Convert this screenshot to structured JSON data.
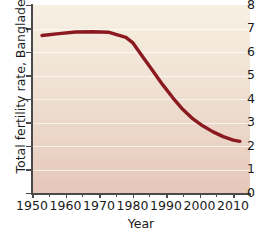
{
  "chart_data": {
    "type": "line",
    "title": "",
    "xlabel": "Year",
    "ylabel": "Total fertility rate, Bangladesh",
    "xlim": [
      1950,
      2015
    ],
    "ylim": [
      0,
      8
    ],
    "grid": true,
    "legend": "none",
    "line_color": "#8b1a20",
    "plot_bg_top": "#f7f1e3",
    "plot_bg_bottom": "#e6c7ba",
    "gridline_color": "#ffffff",
    "axis_color": "#4a4a4a",
    "yticks": [
      0,
      1,
      2,
      3,
      4,
      5,
      6,
      7,
      8
    ],
    "ytick_labels": [
      "0",
      "1",
      "2",
      "3",
      "4",
      "5",
      "6",
      "7",
      "8"
    ],
    "xticks_major": [
      1950,
      1960,
      1970,
      1980,
      1990,
      2000,
      2010
    ],
    "xtick_labels": [
      "1950",
      "1960",
      "1970",
      "1980",
      "1990",
      "2000",
      "2010"
    ],
    "xticks_minor": [
      1955,
      1965,
      1975,
      1985,
      1995,
      2005,
      2015
    ],
    "series": [
      {
        "name": "Total fertility rate, Bangladesh",
        "x": [
          1953,
          1958,
          1963,
          1968,
          1973,
          1978,
          1980,
          1983,
          1986,
          1989,
          1992,
          1995,
          1998,
          2001,
          2004,
          2007,
          2010,
          2012
        ],
        "values": [
          6.7,
          6.78,
          6.85,
          6.86,
          6.84,
          6.62,
          6.4,
          5.8,
          5.2,
          4.6,
          4.05,
          3.55,
          3.15,
          2.85,
          2.6,
          2.4,
          2.25,
          2.2
        ]
      }
    ]
  }
}
